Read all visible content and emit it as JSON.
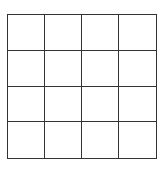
{
  "grid": {
    "rows": 4,
    "columns": 4,
    "line_color": "#333333",
    "background_color": "#ffffff",
    "cells": [
      [
        "",
        "",
        "",
        ""
      ],
      [
        "",
        "",
        "",
        ""
      ],
      [
        "",
        "",
        "",
        ""
      ],
      [
        "",
        "",
        "",
        ""
      ]
    ]
  }
}
